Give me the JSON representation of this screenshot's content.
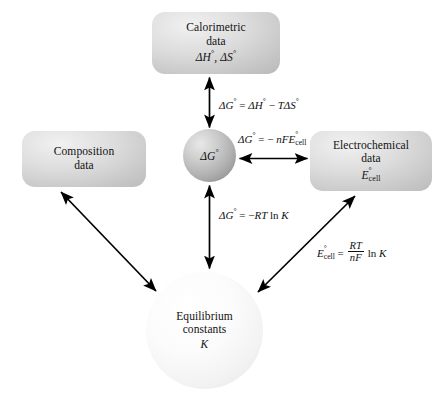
{
  "diagram": {
    "nodes": {
      "calorimetric": {
        "line1": "Calorimetric",
        "line2": "data",
        "formula": "ΔH°, ΔS°",
        "shape": "rounded-box",
        "fill": "#d4d4d4"
      },
      "composition": {
        "line1": "Composition",
        "line2": "data",
        "shape": "rounded-box",
        "fill": "#d4d4d4"
      },
      "electrochemical": {
        "line1": "Electrochemical",
        "line2": "data",
        "formula": "E°cell",
        "shape": "rounded-box",
        "fill": "#d4d4d4"
      },
      "gibbs": {
        "label": "ΔG°",
        "shape": "circle",
        "fill": "#b0b0b0"
      },
      "equilibrium": {
        "line1": "Equilibrium",
        "line2": "constants",
        "formula": "K",
        "shape": "circle",
        "fill": "#f4f4f4"
      }
    },
    "equations": {
      "gibbs_helmholtz": "ΔG° = ΔH° − TΔS°",
      "nernst_gibbs": "ΔG° = − nFE°cell",
      "gibbs_k": "ΔG° = −RT ln K",
      "cell_k": "E°cell = (RT/nF) ln K"
    },
    "connectors": [
      {
        "name": "gibbs-to-calorimetric",
        "from": "gibbs",
        "to": "calorimetric",
        "heads": "both",
        "label": "gibbs_helmholtz"
      },
      {
        "name": "gibbs-to-electrochemical",
        "from": "gibbs",
        "to": "electrochemical",
        "heads": "both",
        "label": "nernst_gibbs"
      },
      {
        "name": "gibbs-to-equilibrium",
        "from": "gibbs",
        "to": "equilibrium",
        "heads": "both",
        "label": "gibbs_k"
      },
      {
        "name": "composition-to-equilibrium",
        "from": "composition",
        "to": "equilibrium",
        "heads": "both",
        "label": null
      },
      {
        "name": "electrochemical-to-equilibrium",
        "from": "electrochemical",
        "to": "equilibrium",
        "heads": "both",
        "label": "cell_k"
      }
    ],
    "colors": {
      "background": "#ffffff",
      "arrow": "#000000",
      "text": "#111111"
    }
  }
}
